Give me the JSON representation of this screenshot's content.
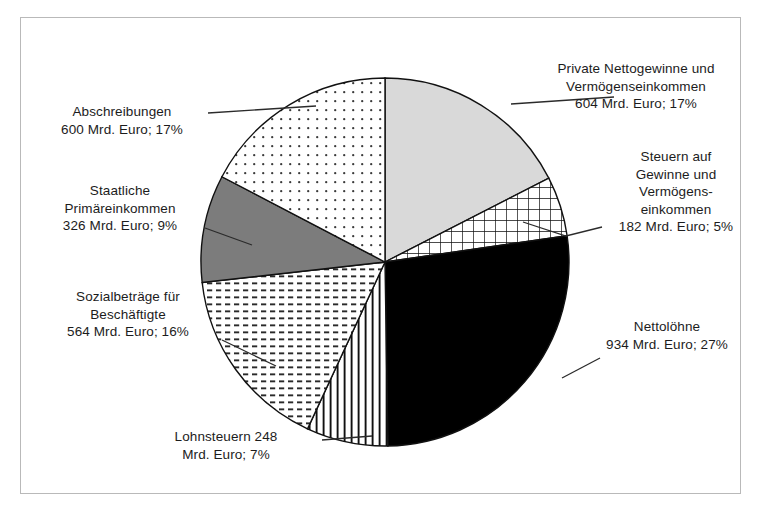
{
  "figure": {
    "border_color": "#b9b9b9",
    "background": "#ffffff"
  },
  "chart_data": {
    "type": "pie",
    "title": "",
    "unit": "Mrd. Euro",
    "total": 3458,
    "legend_position": "callout-labels",
    "categories": [
      "Private Nettogewinne und Vermögenseinkommen",
      "Steuern auf Gewinne und Vermögenseinkommen",
      "Nettolöhne",
      "Lohnsteuern",
      "Sozialbeträge für Beschäftigte",
      "Staatliche Primäreinkommen",
      "Abschreibungen"
    ],
    "values": [
      604,
      182,
      934,
      248,
      564,
      326,
      600
    ],
    "percents": [
      17,
      5,
      27,
      7,
      16,
      9,
      17
    ],
    "slices": [
      {
        "name": "Private Nettogewinne und Vermögenseinkommen",
        "value": 604,
        "percent": 17,
        "fill": "#d9d9d9",
        "pattern": "solid-light-gray",
        "start_angle": 0,
        "end_angle": 62.9
      },
      {
        "name": "Steuern auf Gewinne und Vermögenseinkommen",
        "value": 182,
        "percent": 5,
        "fill": "#ffffff",
        "pattern": "grid",
        "start_angle": 62.9,
        "end_angle": 81.8
      },
      {
        "name": "Nettolöhne",
        "value": 934,
        "percent": 27,
        "fill": "#000000",
        "pattern": "solid-black",
        "start_angle": 81.8,
        "end_angle": 179.1
      },
      {
        "name": "Lohnsteuern",
        "value": 248,
        "percent": 7,
        "fill": "#ffffff",
        "pattern": "vertical-stripes",
        "start_angle": 179.1,
        "end_angle": 204.9
      },
      {
        "name": "Sozialbeträge für Beschäftigte",
        "value": 564,
        "percent": 16,
        "fill": "#ffffff",
        "pattern": "horizontal-dashes",
        "start_angle": 204.9,
        "end_angle": 263.6
      },
      {
        "name": "Staatliche Primäreinkommen",
        "value": 326,
        "percent": 9,
        "fill": "#7c7c7c",
        "pattern": "solid-dark-gray",
        "start_angle": 263.6,
        "end_angle": 297.6
      },
      {
        "name": "Abschreibungen",
        "value": 600,
        "percent": 17,
        "fill": "#ffffff",
        "pattern": "dots",
        "start_angle": 297.6,
        "end_angle": 360
      }
    ]
  },
  "labels": {
    "private": "Private Nettogewinne und\nVermögenseinkommen\n604 Mrd. Euro; 17%",
    "steuern": "Steuern auf\nGewinne und\nVermögens-\neinkommen\n182 Mrd. Euro; 5%",
    "nettoloehne": "Nettolöhne\n934 Mrd. Euro; 27%",
    "lohnsteuern": "Lohnsteuern 248\nMrd. Euro; 7%",
    "sozialbetraege": "Sozialbeträge für\nBeschäftigte\n564 Mrd. Euro; 16%",
    "staatliche": "Staatliche\nPrimäreinkommen\n326 Mrd. Euro; 9%",
    "abschreibungen": "Abschreibungen\n600 Mrd. Euro; 17%"
  }
}
